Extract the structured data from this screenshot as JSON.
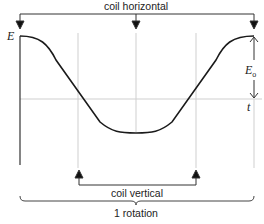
{
  "diagram": {
    "labels": {
      "top_bracket": "coil horizontal",
      "mid_bracket": "coil vertical",
      "bottom_brace": "1 rotation",
      "y_axis": "E",
      "x_axis": "t",
      "amplitude_main": "E",
      "amplitude_sub": "o"
    },
    "curve": {
      "type": "cosine",
      "description": "One full period of E = E0 cos(wt), starting at maximum, minimum at half rotation, returning to maximum"
    },
    "markers": {
      "coil_horizontal_positions": [
        "start",
        "half rotation",
        "full rotation"
      ],
      "coil_vertical_positions": [
        "quarter rotation",
        "three-quarter rotation"
      ]
    },
    "colors": {
      "curve": "#1a1a1a",
      "axis": "#333333",
      "gridline": "#cccccc",
      "text": "#222222"
    }
  }
}
